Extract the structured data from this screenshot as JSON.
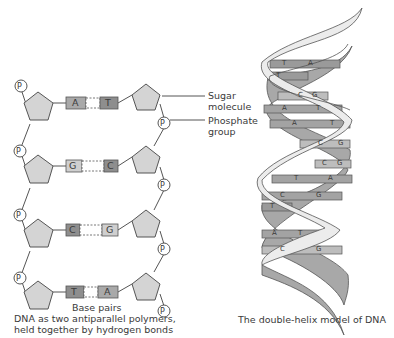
{
  "left_diagram": {
    "phosphate_symbol": "P",
    "base_pairs": [
      {
        "left": "A",
        "right": "T"
      },
      {
        "left": "G",
        "right": "C"
      },
      {
        "left": "C",
        "right": "G"
      },
      {
        "left": "T",
        "right": "A"
      }
    ],
    "labels": {
      "sugar_line1": "Sugar",
      "sugar_line2": "molecule",
      "phosphate_line1": "Phosphate",
      "phosphate_line2": "group",
      "base_pairs": "Base pairs"
    },
    "caption_lines": [
      "DNA as two antiparallel polymers,",
      "held together by hydrogen bonds",
      "between complementary bases"
    ]
  },
  "right_diagram": {
    "caption": "The double-helix model of DNA",
    "rungs": [
      {
        "left": "T",
        "right": "A"
      },
      {
        "left": "T",
        "right": ""
      },
      {
        "left": "C",
        "right": "G"
      },
      {
        "left": "A",
        "right": "T"
      },
      {
        "left": "A",
        "right": "T"
      },
      {
        "left": "C",
        "right": "G"
      },
      {
        "left": "C",
        "right": "G"
      },
      {
        "left": "T",
        "right": "A"
      },
      {
        "left": "C",
        "right": "G"
      },
      {
        "left": "T",
        "right": ""
      },
      {
        "left": "A",
        "right": "T"
      },
      {
        "left": "C",
        "right": "G"
      }
    ]
  },
  "colors": {
    "sugar_fill": "#d4d4d4",
    "outline": "#555555",
    "base_dark": "#8e8e8e",
    "base_mid": "#a9a9a9",
    "base_light": "#cfcfcf",
    "ribbon_light": "#ececec",
    "ribbon_dark": "#a8a8a8"
  }
}
